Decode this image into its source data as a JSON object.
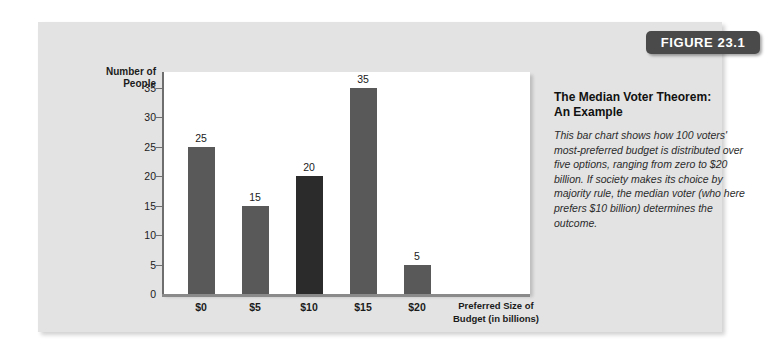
{
  "figure": {
    "badge_label": "FIGURE 23.1"
  },
  "caption": {
    "title_line1": "The Median Voter Theorem:",
    "title_line2": "An Example",
    "body": "This bar chart shows how 100 voters' most-preferred budget is distributed over five options, ranging from zero to $20 billion. If society makes its choice by majority rule, the median voter (who here prefers $10 billion) determines the outcome."
  },
  "chart_data": {
    "type": "bar",
    "title": "",
    "categories": [
      "$0",
      "$5",
      "$10",
      "$15",
      "$20"
    ],
    "values": [
      25,
      15,
      20,
      35,
      5
    ],
    "data_labels": [
      "25",
      "15",
      "20",
      "35",
      "5"
    ],
    "highlight_index": 2,
    "xlabel_line1": "Preferred Size of",
    "xlabel_line2": "Budget (in billions)",
    "ylabel_line1": "Number of",
    "ylabel_line2": "People",
    "ylim": [
      0,
      37
    ],
    "yticks": [
      0,
      5,
      10,
      15,
      20,
      25,
      30,
      35
    ],
    "ytick_labels": [
      "0",
      "5",
      "10",
      "15",
      "20",
      "25",
      "30",
      "35"
    ],
    "grid": false,
    "legend": "none",
    "bar_color": "#595959",
    "highlight_bar_color": "#2b2b2b",
    "plot_background": "#ffffff",
    "card_background": "#e3e3e3",
    "badge_color": "#4a4a4a"
  }
}
